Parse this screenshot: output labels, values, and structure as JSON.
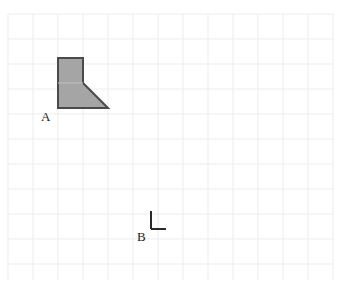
{
  "header": {
    "clipped_text": "figure shown on the grid paper"
  },
  "canvas": {
    "width": 343,
    "height": 286,
    "background_color": "#ffffff"
  },
  "grid": {
    "cell_size": 25,
    "line_color": "#ededed",
    "line_width": 1,
    "left": 8,
    "top": 14,
    "right": 334,
    "bottom": 280,
    "columns": 13,
    "rows": 10
  },
  "shapes": [
    {
      "name": "figure-a",
      "type": "polygon",
      "label": "A",
      "label_x": 41,
      "label_y": 110,
      "fill_color": "#a5a5a5",
      "stroke_color": "#4a4a4a",
      "stroke_width": 2,
      "points": "58,58 83,58 83,83 108,108 58,108",
      "interior_line": {
        "x1": 58,
        "y1": 83,
        "x2": 83,
        "y2": 83,
        "color": "#c2c2c2"
      }
    },
    {
      "name": "corner-mark-b",
      "type": "right-angle-mark",
      "label": "B",
      "label_x": 137,
      "label_y": 230,
      "stroke_color": "#2b2b2b",
      "stroke_width": 2,
      "vertical": {
        "x1": 151,
        "y1": 211,
        "x2": 151,
        "y2": 229
      },
      "horizontal": {
        "x1": 151,
        "y1": 229,
        "x2": 166,
        "y2": 229
      }
    }
  ]
}
